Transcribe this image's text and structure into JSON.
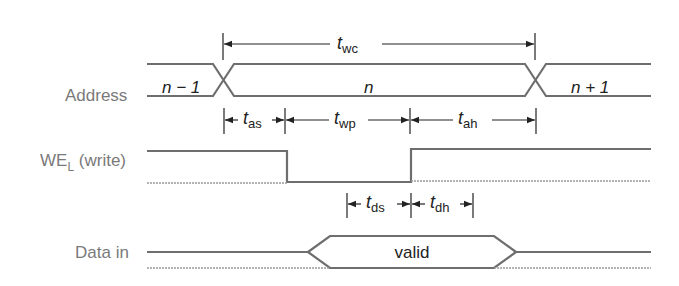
{
  "diagram": {
    "colors": {
      "signal": "#6e6e6e",
      "annotation": "#222222",
      "label": "#7a7a7a",
      "background": "#ffffff"
    },
    "signals": [
      {
        "name": "Address",
        "values": [
          "n − 1",
          "n",
          "n + 1"
        ]
      },
      {
        "name": "WE",
        "subscript": "L",
        "suffix": " (write)"
      },
      {
        "name": "Data in",
        "values": [
          "valid"
        ]
      }
    ],
    "timing": {
      "wc": {
        "symbol": "t",
        "sub": "wc"
      },
      "as": {
        "symbol": "t",
        "sub": "as"
      },
      "wp": {
        "symbol": "t",
        "sub": "wp"
      },
      "ah": {
        "symbol": "t",
        "sub": "ah"
      },
      "ds": {
        "symbol": "t",
        "sub": "ds"
      },
      "dh": {
        "symbol": "t",
        "sub": "dh"
      }
    },
    "labels": {
      "address": "Address",
      "we_main": "WE",
      "we_sub": "L",
      "we_suffix": " (write)",
      "data_in": "Data in",
      "addr_prev": "n − 1",
      "addr_cur": "n",
      "addr_next": "n + 1",
      "data_valid": "valid"
    }
  }
}
